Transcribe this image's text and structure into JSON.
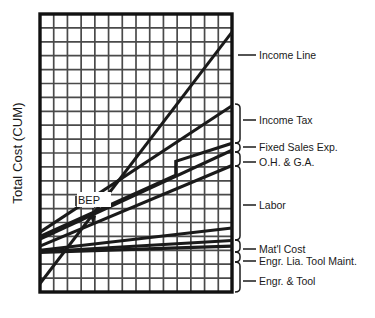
{
  "chart_data": {
    "type": "line",
    "title": "",
    "subtitle": "",
    "xlabel": "",
    "ylabel": "Total Cost  (CUM)",
    "xlim": [
      0,
      14
    ],
    "ylim": [
      0,
      20
    ],
    "grid": true,
    "grid_columns": 14,
    "grid_rows": 20,
    "legend_position": "right-brackets",
    "annotations": [
      {
        "label": "BEP",
        "meaning": "break-even point",
        "x": 4.1,
        "y": 6.4
      }
    ],
    "series": [
      {
        "name": "Income Line",
        "start": [
          0.0,
          0.6
        ],
        "end": [
          14.0,
          18.7
        ],
        "emphasis": "heavy",
        "label_side": "right"
      },
      {
        "name": "Income Tax",
        "start": [
          0.0,
          4.3
        ],
        "end": [
          14.0,
          13.4
        ],
        "emphasis": "heavy",
        "label_side": "right"
      },
      {
        "name": "Fixed Sales Exp.",
        "start": [
          0.0,
          4.0
        ],
        "end": [
          14.0,
          10.7
        ],
        "emphasis": "heavy",
        "step": {
          "x": 9.9,
          "from_y": 8.4,
          "to_y": 9.4
        },
        "label_side": "right"
      },
      {
        "name": "O.H. & G.A.",
        "start": [
          0.0,
          3.8
        ],
        "end": [
          14.0,
          10.2
        ],
        "emphasis": "heavy",
        "label_side": "right"
      },
      {
        "name": "Labor",
        "start": [
          0.0,
          3.3
        ],
        "end": [
          14.0,
          9.1
        ],
        "emphasis": "heavy",
        "label_side": "right"
      },
      {
        "name": "Mat'l Cost",
        "start": [
          0.0,
          3.0
        ],
        "end": [
          14.0,
          4.6
        ],
        "emphasis": "heavy",
        "label_side": "right"
      },
      {
        "name": "Engr. Lia. Tool Maint.",
        "start": [
          0.0,
          2.9
        ],
        "end": [
          14.0,
          3.7
        ],
        "emphasis": "heavy",
        "label_side": "right"
      },
      {
        "name": "Engr. & Tool",
        "start": [
          0.0,
          2.85
        ],
        "end": [
          14.0,
          3.3
        ],
        "emphasis": "heavy",
        "label_side": "right"
      }
    ],
    "bracket_groups": [
      {
        "label": "Income Line",
        "type": "tick",
        "y_top": 55.0,
        "y_bottom": 55.0,
        "tick_y": 55.0
      },
      {
        "label": "Income Tax",
        "type": "bracket",
        "y_top": 104.0,
        "y_bottom": 143.0,
        "tick_y": 120.0
      },
      {
        "label": "Fixed Sales Exp.",
        "type": "bracket",
        "y_top": 143.0,
        "y_bottom": 152.0,
        "tick_y": 147.0
      },
      {
        "label": "O.H. & G.A.",
        "type": "bracket",
        "y_top": 152.0,
        "y_bottom": 166.0,
        "tick_y": 162.0
      },
      {
        "label": "Labor",
        "type": "bracket",
        "y_top": 166.0,
        "y_bottom": 240.0,
        "tick_y": 205.0
      },
      {
        "label": "Mat'l Cost",
        "type": "bracket",
        "y_top": 240.0,
        "y_bottom": 252.0,
        "tick_y": 249.0
      },
      {
        "label": "Engr. Lia. Tool Maint.",
        "type": "bracket",
        "y_top": 252.0,
        "y_bottom": 262.0,
        "tick_y": 261.0
      },
      {
        "label": "Engr. & Tool",
        "type": "bracket",
        "y_top": 262.0,
        "y_bottom": 292.0,
        "tick_y": 281.0
      }
    ]
  },
  "axes": {
    "y_title": "Total Cost  (CUM)",
    "x_title": ""
  },
  "colors": {
    "line": "#1a1a1a",
    "grid": "#4a4a4a",
    "border": "#111111",
    "background": "#ffffff",
    "text": "#1a1a1a"
  },
  "plot_geometry": {
    "left": 40,
    "top": 14,
    "right": 232,
    "bottom": 292
  }
}
